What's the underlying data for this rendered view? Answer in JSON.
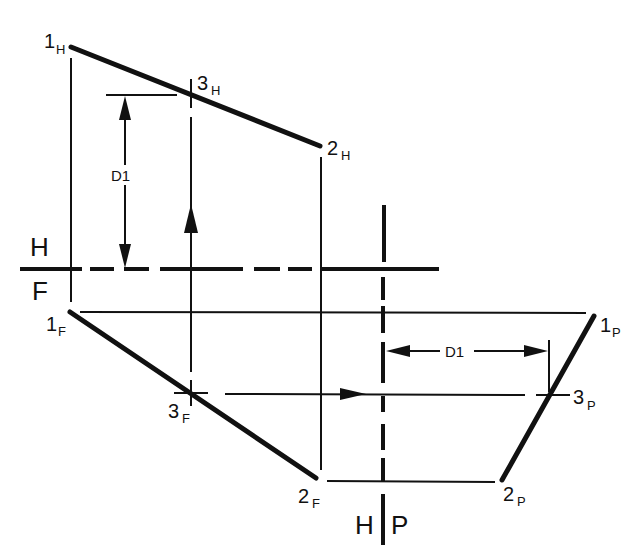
{
  "diagram": {
    "type": "descriptive-geometry-auxiliary-view",
    "colors": {
      "ink": "#111111",
      "background": "#ffffff"
    },
    "fold_lines": [
      {
        "id": "HF",
        "upper": "H",
        "lower": "F"
      },
      {
        "id": "HP",
        "left": "H",
        "right": "P"
      }
    ],
    "points": {
      "p1H": {
        "num": "1",
        "sub": "H"
      },
      "p2H": {
        "num": "2",
        "sub": "H"
      },
      "p3H": {
        "num": "3",
        "sub": "H"
      },
      "p1F": {
        "num": "1",
        "sub": "F"
      },
      "p2F": {
        "num": "2",
        "sub": "F"
      },
      "p3F": {
        "num": "3",
        "sub": "F"
      },
      "p1P": {
        "num": "1",
        "sub": "P"
      },
      "p2P": {
        "num": "2",
        "sub": "P"
      },
      "p3P": {
        "num": "3",
        "sub": "P"
      }
    },
    "dimensions": {
      "vertical": {
        "label": "D1"
      },
      "horizontal": {
        "label": "D1"
      }
    }
  }
}
